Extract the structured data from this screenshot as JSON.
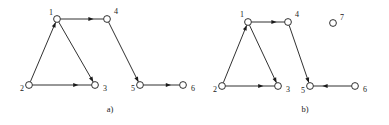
{
  "figure": {
    "background_color": "#ffffff",
    "ink_color": "#1a1a1a",
    "node_fill_color": "#ffffff",
    "node_radius": 3.4,
    "width": 389,
    "height": 125
  },
  "panels": [
    {
      "id": "panel-a",
      "caption": "a)",
      "caption_x": 110,
      "caption_y": 112,
      "nodes": [
        {
          "id": "a1",
          "label": "1",
          "x": 57,
          "y": 19,
          "label_x": 49,
          "label_y": 13,
          "isolated": false
        },
        {
          "id": "a2",
          "label": "2",
          "x": 29,
          "y": 85,
          "label_x": 20,
          "label_y": 89,
          "isolated": false
        },
        {
          "id": "a3",
          "label": "3",
          "x": 95,
          "y": 85,
          "label_x": 103,
          "label_y": 89,
          "isolated": false
        },
        {
          "id": "a4",
          "label": "4",
          "x": 107,
          "y": 19,
          "label_x": 114,
          "label_y": 12,
          "isolated": false
        },
        {
          "id": "a5",
          "label": "5",
          "x": 140,
          "y": 85,
          "label_x": 131,
          "label_y": 89,
          "isolated": false
        },
        {
          "id": "a6",
          "label": "6",
          "x": 183,
          "y": 85,
          "label_x": 191,
          "label_y": 89,
          "isolated": false
        }
      ],
      "edges": [
        {
          "id": "a-1-4",
          "from": "a1",
          "to": "a4",
          "directed": true
        },
        {
          "id": "a-2-1",
          "from": "a2",
          "to": "a1",
          "directed": true
        },
        {
          "id": "a-1-3",
          "from": "a1",
          "to": "a3",
          "directed": true
        },
        {
          "id": "a-2-3",
          "from": "a2",
          "to": "a3",
          "directed": true
        },
        {
          "id": "a-4-5",
          "from": "a4",
          "to": "a5",
          "directed": true
        },
        {
          "id": "a-5-6",
          "from": "a5",
          "to": "a6",
          "directed": true
        }
      ]
    },
    {
      "id": "panel-b",
      "caption": "b)",
      "caption_x": 305,
      "caption_y": 112,
      "nodes": [
        {
          "id": "b1",
          "label": "1",
          "x": 248,
          "y": 22,
          "label_x": 240,
          "label_y": 15,
          "isolated": false
        },
        {
          "id": "b2",
          "label": "2",
          "x": 222,
          "y": 86,
          "label_x": 213,
          "label_y": 90,
          "isolated": false
        },
        {
          "id": "b3",
          "label": "3",
          "x": 278,
          "y": 86,
          "label_x": 286,
          "label_y": 90,
          "isolated": false
        },
        {
          "id": "b4",
          "label": "4",
          "x": 288,
          "y": 22,
          "label_x": 295,
          "label_y": 15,
          "isolated": false
        },
        {
          "id": "b5",
          "label": "5",
          "x": 310,
          "y": 86,
          "label_x": 301,
          "label_y": 91,
          "isolated": false
        },
        {
          "id": "b6",
          "label": "6",
          "x": 355,
          "y": 86,
          "label_x": 363,
          "label_y": 90,
          "isolated": false
        },
        {
          "id": "b7",
          "label": "7",
          "x": 333,
          "y": 23,
          "label_x": 340,
          "label_y": 18,
          "isolated": true
        }
      ],
      "edges": [
        {
          "id": "b-1-4",
          "from": "b1",
          "to": "b4",
          "directed": true
        },
        {
          "id": "b-2-1",
          "from": "b2",
          "to": "b1",
          "directed": true
        },
        {
          "id": "b-1-3",
          "from": "b1",
          "to": "b3",
          "directed": true
        },
        {
          "id": "b-2-3",
          "from": "b2",
          "to": "b3",
          "directed": true
        },
        {
          "id": "b-4-5",
          "from": "b4",
          "to": "b5",
          "directed": true
        },
        {
          "id": "b-6-5",
          "from": "b6",
          "to": "b5",
          "directed": true
        }
      ]
    }
  ]
}
